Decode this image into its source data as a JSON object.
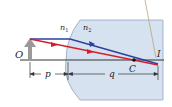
{
  "diagram": {
    "labels": {
      "object": "O",
      "image": "I",
      "center": "C",
      "n1": "n",
      "n1_sub": "1",
      "n2": "n",
      "n2_sub": "2",
      "object_distance": "p",
      "image_distance": "q"
    },
    "colors": {
      "glass_fill": "#d6e2f0",
      "glass_stroke": "#8fa6c2",
      "axis": "#333333",
      "object_arrow": "#9a9a9a",
      "ray_blue": "#2b3f9e",
      "ray_red": "#d4202e",
      "pointer_line": "#b8a878",
      "center_dot": "#111111"
    }
  }
}
